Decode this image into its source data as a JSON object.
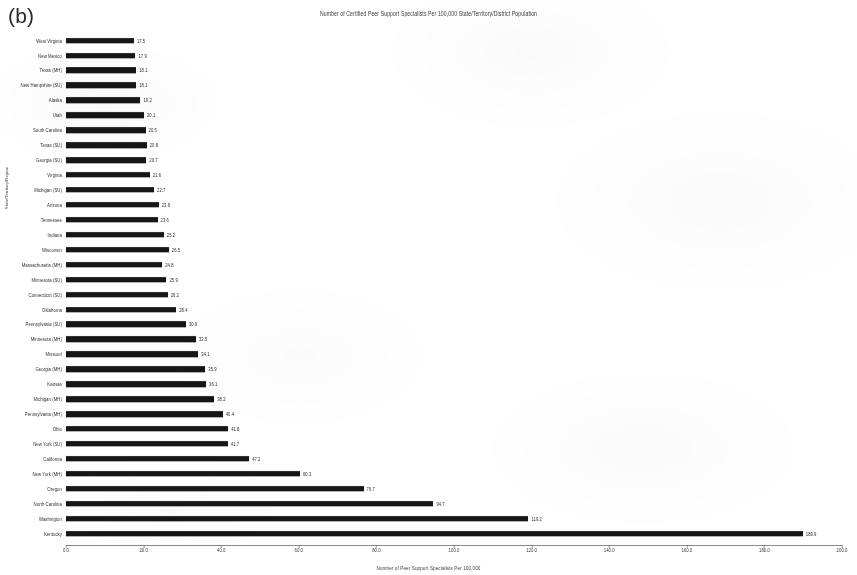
{
  "figure": {
    "panel_label": "(b)"
  },
  "chart_data": {
    "type": "bar",
    "orientation": "horizontal",
    "title": "Number of Certified Peer Support Specialists Per 100,000 State/Territory/District Population",
    "xlabel": "Number of Peer Support Specialists Per 100,000",
    "ylabel": "State/Territory/Region",
    "xlim": [
      0.0,
      200.0
    ],
    "xticks": [
      "0.0",
      "20.0",
      "40.0",
      "60.0",
      "80.0",
      "100.0",
      "120.0",
      "140.0",
      "160.0",
      "180.0",
      "200.0"
    ],
    "xtick_values": [
      0,
      20,
      40,
      60,
      80,
      100,
      120,
      140,
      160,
      180,
      200
    ],
    "grid": false,
    "bar_color": "#161616",
    "categories": [
      "West Virginia",
      "New Mexico",
      "Texas (MH)",
      "New Hampshire (SU)",
      "Alaska",
      "Utah",
      "South Carolina",
      "Texas (SU)",
      "Georgia (SU)",
      "Virginia",
      "Michigan (SU)",
      "Arizona",
      "Tennessee",
      "Indiana",
      "Wisconsin",
      "Massachusetts (MH)",
      "Minnesota (SU)",
      "Connecticut (SU)",
      "Oklahoma",
      "Pennsylvania (SU)",
      "Minnesota (MH)",
      "Missouri",
      "Georgia (MH)",
      "Kansas",
      "Michigan (MH)",
      "Pennsylvania (MH)",
      "Ohio",
      "New York (SU)",
      "California",
      "New York (MH)",
      "Oregon",
      "North Carolina",
      "Washington",
      "Kentucky"
    ],
    "values": [
      17.5,
      17.9,
      18.1,
      18.1,
      19.2,
      20.1,
      20.5,
      20.8,
      20.7,
      21.6,
      22.7,
      23.9,
      23.6,
      25.2,
      26.5,
      24.8,
      25.9,
      26.2,
      28.4,
      30.9,
      33.5,
      34.1,
      35.9,
      36.1,
      38.2,
      40.4,
      41.8,
      41.7,
      47.2,
      60.3,
      76.7,
      94.7,
      119.2,
      189.9
    ],
    "value_labels": [
      "17.5",
      "17.9",
      "18.1",
      "18.1",
      "19.2",
      "20.1",
      "20.5",
      "20.8",
      "20.7",
      "21.6",
      "22.7",
      "23.9",
      "23.6",
      "25.2",
      "26.5",
      "24.8",
      "25.9",
      "26.2",
      "28.4",
      "30.9",
      "33.5",
      "34.1",
      "35.9",
      "36.1",
      "38.2",
      "40.4",
      "41.8",
      "41.7",
      "47.2",
      "60.3",
      "76.7",
      "94.7",
      "119.2",
      "189.9"
    ]
  }
}
